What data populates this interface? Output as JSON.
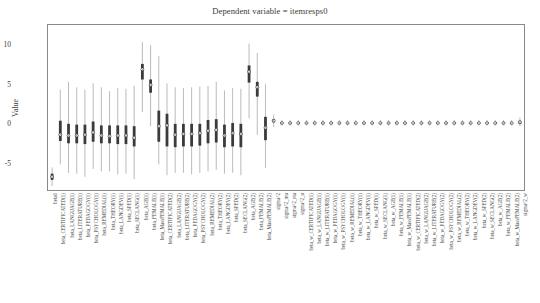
{
  "chart_data": {
    "type": "box",
    "title": "Dependent variable = itemresps0",
    "xlabel": "",
    "ylabel": "Value",
    "ylim": [
      -8.6,
      12.6
    ],
    "yticks": [
      -5,
      0,
      5,
      10
    ],
    "ytick_labels": [
      "-5",
      "0",
      "5",
      "10"
    ],
    "grid": false,
    "legend": null,
    "categories": [
      "beta0",
      "beta_CERTIFICATED(1)",
      "beta_LANGUAGE(1)",
      "beta_LITERATURE(1)",
      "beta_PEDAGOGY(1)",
      "beta_PSYCHOLOGY(1)",
      "beta_REMEDIAL(1)",
      "beta_THEORY(1)",
      "beta_LANGDEV(1)",
      "beta_SPED(1)",
      "beta_SECLANG(1)",
      "beta_AGE(1)",
      "beta_FEMALE(1)",
      "beta_MassFEMALE(1)",
      "beta_CERTIFICATED(2)",
      "beta_LANGUAGE(2)",
      "beta_LITERATURE(2)",
      "beta_PEDAGOGY(2)",
      "beta_PSYCHOLOGY(2)",
      "beta_REMEDIAL(2)",
      "beta_THEORY(2)",
      "beta_LANGDEV(2)",
      "beta_SPED(2)",
      "beta_SECLANG(2)",
      "beta_AGE(2)",
      "beta_FEMALE(2)",
      "beta_MassFEMALE(2)",
      "sigma^2",
      "sigma^2_mu",
      "sigma^2_eta",
      "sigma^2_u",
      "beta_w_CERTIFICATED(1)",
      "beta_w_LANGUAGE(1)",
      "beta_w_LITERATURE(1)",
      "beta_w_PEDAGOGY(1)",
      "beta_w_PSYCHOLOGY(1)",
      "beta_w_REMEDIAL(1)",
      "beta_w_THEORY(1)",
      "beta_w_LANGDEV(1)",
      "beta_w_SPED(1)",
      "beta_w_SECLANG(1)",
      "beta_w_AGE(1)",
      "beta_w_FEMALE(1)",
      "beta_w_MassFEMALE(1)",
      "beta_w_CERTIFICATED(2)",
      "beta_w_LANGUAGE(2)",
      "beta_w_LITERATURE(2)",
      "beta_w_PEDAGOGY(2)",
      "beta_w_PSYCHOLOGY(2)",
      "beta_w_REMEDIAL(2)",
      "beta_w_THEORY(2)",
      "beta_w_LANGDEV(2)",
      "beta_w_SPED(2)",
      "beta_w_SECLANG(2)",
      "beta_w_AGE(2)",
      "beta_w_FEMALE(2)",
      "beta_w_MassFEMALE(2)",
      "sigma^2_w"
    ],
    "boxes": [
      {
        "min": -8.1,
        "q1": -7.3,
        "median": -6.9,
        "q3": -6.5,
        "max": -5.7
      },
      {
        "min": -5.3,
        "q1": -2.3,
        "median": -1.5,
        "q3": 0.3,
        "max": 4.3
      },
      {
        "min": -6.4,
        "q1": -2.6,
        "median": -1.6,
        "q3": -0.1,
        "max": 5.3
      },
      {
        "min": -6.5,
        "q1": -2.6,
        "median": -1.6,
        "q3": -0.2,
        "max": 4.6
      },
      {
        "min": -6.9,
        "q1": -2.7,
        "median": -1.5,
        "q3": -0.2,
        "max": 4.3
      },
      {
        "min": -5.9,
        "q1": -2.4,
        "median": -1.2,
        "q3": 0.2,
        "max": 5.1
      },
      {
        "min": -6.2,
        "q1": -2.6,
        "median": -1.6,
        "q3": -0.3,
        "max": 4.6
      },
      {
        "min": -6.2,
        "q1": -2.6,
        "median": -1.7,
        "q3": -0.3,
        "max": 4.1
      },
      {
        "min": -6.6,
        "q1": -2.7,
        "median": -1.6,
        "q3": -0.3,
        "max": 4.5
      },
      {
        "min": -6.5,
        "q1": -2.7,
        "median": -1.6,
        "q3": -0.3,
        "max": 4.4
      },
      {
        "min": -7.2,
        "q1": -3.0,
        "median": -1.9,
        "q3": -0.4,
        "max": 4.8
      },
      {
        "min": 1.4,
        "q1": 5.6,
        "median": 6.9,
        "q3": 7.6,
        "max": 10.4
      },
      {
        "min": -0.4,
        "q1": 3.9,
        "median": 4.9,
        "q3": 5.6,
        "max": 10.0
      },
      {
        "min": -5.3,
        "q1": -2.4,
        "median": -0.4,
        "q3": 1.6,
        "max": 8.6
      },
      {
        "min": -6.7,
        "q1": -3.0,
        "median": -0.3,
        "q3": 1.2,
        "max": 5.1
      },
      {
        "min": -6.4,
        "q1": -3.1,
        "median": -1.5,
        "q3": -0.1,
        "max": 4.6
      },
      {
        "min": -6.4,
        "q1": -3.0,
        "median": -1.4,
        "q3": -0.1,
        "max": 4.5
      },
      {
        "min": -6.6,
        "q1": -3.0,
        "median": -1.4,
        "q3": -0.1,
        "max": 4.6
      },
      {
        "min": -6.4,
        "q1": -2.9,
        "median": -1.3,
        "q3": -0.1,
        "max": 4.7
      },
      {
        "min": -6.2,
        "q1": -2.6,
        "median": -1.0,
        "q3": 0.4,
        "max": 4.8
      },
      {
        "min": -6.0,
        "q1": -2.5,
        "median": -0.9,
        "q3": 0.5,
        "max": 5.3
      },
      {
        "min": -6.5,
        "q1": -3.1,
        "median": -1.6,
        "q3": -0.2,
        "max": 4.2
      },
      {
        "min": -6.4,
        "q1": -3.0,
        "median": -1.3,
        "q3": 0.0,
        "max": 4.5
      },
      {
        "min": -6.7,
        "q1": -3.1,
        "median": -1.4,
        "q3": -0.1,
        "max": 4.4
      },
      {
        "min": 0.6,
        "q1": 5.2,
        "median": 6.6,
        "q3": 7.4,
        "max": 10.2
      },
      {
        "min": -1.5,
        "q1": 3.4,
        "median": 4.6,
        "q3": 5.3,
        "max": 9.0
      },
      {
        "min": -5.8,
        "q1": -2.2,
        "median": -0.6,
        "q3": 0.8,
        "max": 5.0
      },
      {
        "min": -0.5,
        "q1": 0.1,
        "median": 0.3,
        "q3": 0.5,
        "max": 1.1
      },
      {
        "min": -0.3,
        "q1": -0.1,
        "median": 0.0,
        "q3": 0.1,
        "max": 0.4
      },
      {
        "min": -0.3,
        "q1": -0.1,
        "median": 0.0,
        "q3": 0.1,
        "max": 0.4
      },
      {
        "min": -0.3,
        "q1": -0.1,
        "median": 0.0,
        "q3": 0.1,
        "max": 0.4
      },
      {
        "min": -0.3,
        "q1": -0.1,
        "median": 0.0,
        "q3": 0.1,
        "max": 0.4
      },
      {
        "min": -0.3,
        "q1": -0.1,
        "median": 0.0,
        "q3": 0.1,
        "max": 0.4
      },
      {
        "min": -0.3,
        "q1": -0.1,
        "median": 0.0,
        "q3": 0.1,
        "max": 0.4
      },
      {
        "min": -0.3,
        "q1": -0.1,
        "median": 0.0,
        "q3": 0.1,
        "max": 0.4
      },
      {
        "min": -0.3,
        "q1": -0.1,
        "median": 0.0,
        "q3": 0.1,
        "max": 0.4
      },
      {
        "min": -0.3,
        "q1": -0.1,
        "median": 0.0,
        "q3": 0.1,
        "max": 0.4
      },
      {
        "min": -0.3,
        "q1": -0.1,
        "median": 0.0,
        "q3": 0.1,
        "max": 0.4
      },
      {
        "min": -0.3,
        "q1": -0.1,
        "median": 0.0,
        "q3": 0.1,
        "max": 0.4
      },
      {
        "min": -0.3,
        "q1": -0.1,
        "median": 0.0,
        "q3": 0.1,
        "max": 0.4
      },
      {
        "min": -0.3,
        "q1": -0.1,
        "median": 0.0,
        "q3": 0.1,
        "max": 0.4
      },
      {
        "min": -0.3,
        "q1": -0.1,
        "median": 0.0,
        "q3": 0.1,
        "max": 0.4
      },
      {
        "min": -0.3,
        "q1": -0.1,
        "median": 0.0,
        "q3": 0.1,
        "max": 0.4
      },
      {
        "min": -0.3,
        "q1": -0.1,
        "median": 0.0,
        "q3": 0.1,
        "max": 0.4
      },
      {
        "min": -0.3,
        "q1": -0.1,
        "median": 0.0,
        "q3": 0.1,
        "max": 0.4
      },
      {
        "min": -0.3,
        "q1": -0.1,
        "median": 0.0,
        "q3": 0.1,
        "max": 0.4
      },
      {
        "min": -0.3,
        "q1": -0.1,
        "median": 0.0,
        "q3": 0.1,
        "max": 0.4
      },
      {
        "min": -0.3,
        "q1": -0.1,
        "median": 0.0,
        "q3": 0.1,
        "max": 0.4
      },
      {
        "min": -0.3,
        "q1": -0.1,
        "median": 0.0,
        "q3": 0.1,
        "max": 0.4
      },
      {
        "min": -0.3,
        "q1": -0.1,
        "median": 0.0,
        "q3": 0.1,
        "max": 0.4
      },
      {
        "min": -0.3,
        "q1": -0.1,
        "median": 0.0,
        "q3": 0.1,
        "max": 0.4
      },
      {
        "min": -0.3,
        "q1": -0.1,
        "median": 0.0,
        "q3": 0.1,
        "max": 0.4
      },
      {
        "min": -0.3,
        "q1": -0.1,
        "median": 0.0,
        "q3": 0.1,
        "max": 0.4
      },
      {
        "min": -0.3,
        "q1": -0.1,
        "median": 0.0,
        "q3": 0.1,
        "max": 0.4
      },
      {
        "min": -0.3,
        "q1": -0.1,
        "median": 0.0,
        "q3": 0.1,
        "max": 0.4
      },
      {
        "min": -0.3,
        "q1": -0.1,
        "median": 0.0,
        "q3": 0.1,
        "max": 0.4
      },
      {
        "min": -0.3,
        "q1": -0.1,
        "median": 0.0,
        "q3": 0.1,
        "max": 0.4
      },
      {
        "min": -0.4,
        "q1": -0.1,
        "median": 0.1,
        "q3": 0.3,
        "max": 0.7
      }
    ],
    "colors": {
      "box": "#3b3b3b",
      "whisker": "#a9a9a9",
      "median_marker": "#2b2b2b",
      "axis": "#8a8a8a",
      "text": "#3c3c3c",
      "background": "#ffffff"
    }
  }
}
